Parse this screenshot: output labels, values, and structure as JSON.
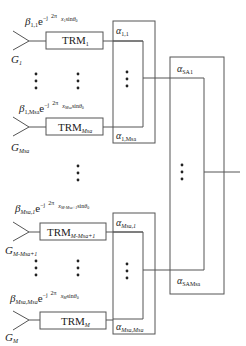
{
  "diagram": {
    "title": "",
    "colors": {
      "line": "#555555",
      "text": "#222222",
      "background": "#ffffff"
    },
    "elements": {
      "antennas": [
        {
          "id": "G1",
          "label": "G",
          "sub": "1"
        },
        {
          "id": "GMsa",
          "label": "G",
          "sub": "Msa"
        },
        {
          "id": "GM-Msa+1",
          "label": "G",
          "sub": "M-Msa+1"
        },
        {
          "id": "GM",
          "label": "G",
          "sub": "M"
        }
      ],
      "trms": [
        {
          "label": "TRM",
          "sub": "1"
        },
        {
          "label": "TRM",
          "sub": "Msa"
        },
        {
          "label": "TRM",
          "sub": "M-Msa+1"
        },
        {
          "label": "TRM",
          "sub": "M"
        }
      ],
      "weights": [
        {
          "beta": "β",
          "beta_sub": "1,1",
          "exp": "e",
          "exp_sup": "-j 2π/λ0 x1 sinθ0"
        },
        {
          "beta": "β",
          "beta_sub": "1,Msa",
          "exp": "e",
          "exp_sup": "-j 2π/λ0 xMsa sinθ0"
        },
        {
          "beta": "β",
          "beta_sub": "Msa,1",
          "exp": "e",
          "exp_sup": "-j 2π/λ0 xM-Msa+1 sinθ0"
        },
        {
          "beta": "β",
          "beta_sub": "Msa,Msa",
          "exp": "e",
          "exp_sup": "-j 2π/λ0 xM sinθ0"
        }
      ],
      "subarray_coeffs": [
        {
          "alpha": "α",
          "sub": "1,1"
        },
        {
          "alpha": "α",
          "sub": "1,Msa"
        },
        {
          "alpha": "α",
          "sub": "Msa,1"
        },
        {
          "alpha": "α",
          "sub": "Msa,Msa"
        }
      ],
      "sa_coeffs": [
        {
          "alpha": "α",
          "sub": "SA1"
        },
        {
          "alpha": "α",
          "sub": "SAMsa"
        }
      ],
      "ellipsis": "⋮"
    },
    "text": {
      "beta": "β",
      "e": "e",
      "minus_j": "−j",
      "two_pi": "2π",
      "lambda0": "λ",
      "lambda_sub": "0",
      "sin": "sin",
      "theta": "θ",
      "theta_sub": "0",
      "x": "x",
      "G": "G",
      "TRM": "TRM",
      "alpha": "α",
      "s_1": "1",
      "s_11": "1,1",
      "s_1Msa": "1,",
      "s_M": "M",
      "s_sa": "sa",
      "s_SA": "SA",
      "s_SA1_sub": "1",
      "s_Msa1_tail": "1",
      "s_comma": ",",
      "s_minus": "-",
      "s_minus1": "-1",
      "s_plus1": "+1"
    }
  }
}
